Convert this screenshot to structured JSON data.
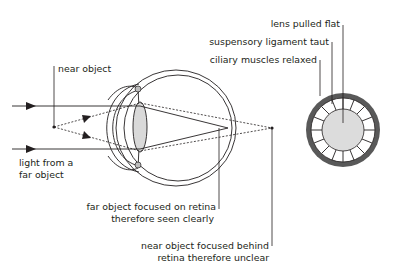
{
  "figure": {
    "colors": {
      "line": "#231f20",
      "lens_fill": "#d9d9d9",
      "ciliary_ring": "#595959",
      "ligament_ring_fill": "#ffffff",
      "ciliary_body": "#bdbdbd"
    }
  },
  "labels": {
    "near_object": "near object",
    "light_far_line1": "light from a",
    "light_far_line2": "far object",
    "far_focused_line1": "far object focused on retina",
    "far_focused_line2": "therefore seen clearly",
    "near_behind_line1": "near object focused behind",
    "near_behind_line2": "retina therefore unclear",
    "lens_flat": "lens pulled flat",
    "ligament_taut": "suspensory ligament taut",
    "ciliary_relaxed": "ciliary muscles relaxed"
  }
}
